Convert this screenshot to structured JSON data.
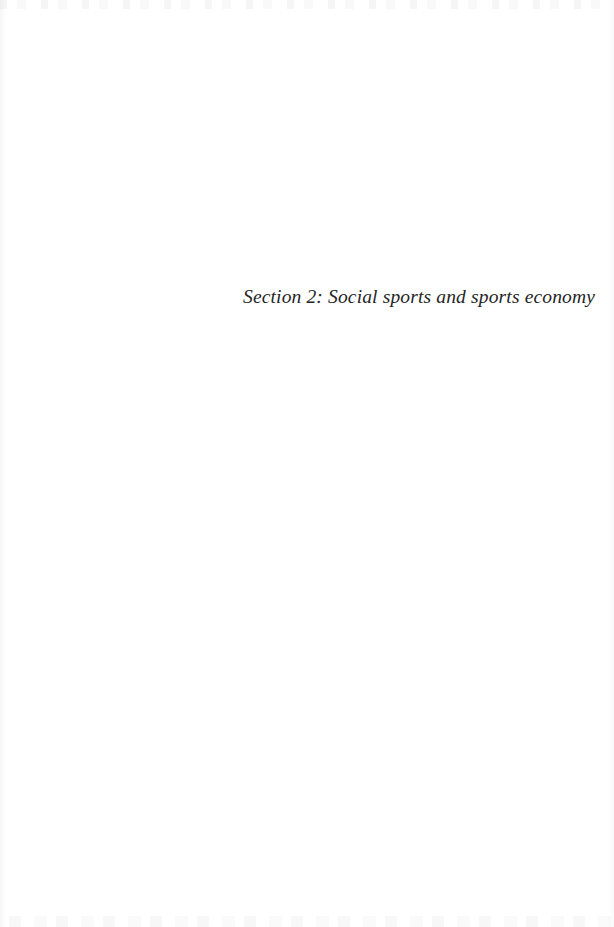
{
  "document": {
    "page_background_color": "#ffffff",
    "text_color": "#262626",
    "type": "section-divider-page"
  },
  "section_divider": {
    "title": "Section 2: Social sports and sports economy",
    "section_label": "Section 2",
    "section_name": "Social sports and sports economy"
  },
  "artifacts": {
    "top_band_name": "scan-edge-speckle-top",
    "bottom_band_name": "scan-edge-speckle-bottom"
  }
}
